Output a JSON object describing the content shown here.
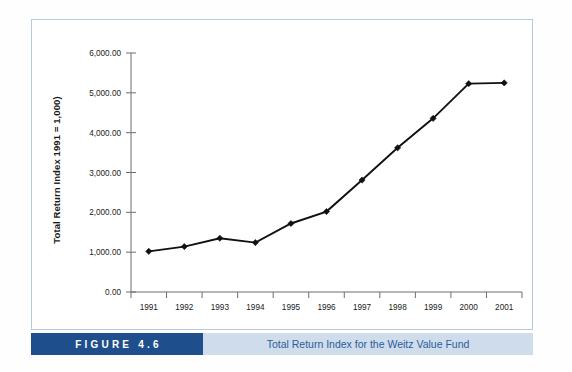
{
  "figure": {
    "number_label": "FIGURE 4.6",
    "caption": "Total Return Index for the Weitz Value Fund"
  },
  "colors": {
    "figure_block_bg": "#1f4e8c",
    "caption_block_bg": "#cfdcec",
    "caption_text": "#2c5c9a",
    "frame_border": "#b9c9dd",
    "series_line": "#111111",
    "axis": "#6d6d6d"
  },
  "chart_data": {
    "type": "line",
    "title": "",
    "xlabel": "",
    "ylabel": "Total Return Index 1991 = 1,000)",
    "categories": [
      "1991",
      "1992",
      "1993",
      "1994",
      "1995",
      "1996",
      "1997",
      "1998",
      "1999",
      "2000",
      "2001"
    ],
    "values": [
      1020,
      1140,
      1350,
      1240,
      1720,
      2020,
      2810,
      3620,
      4360,
      5230,
      5250
    ],
    "series": [
      {
        "name": "Total Return Index",
        "values": [
          1020,
          1140,
          1350,
          1240,
          1720,
          2020,
          2810,
          3620,
          4360,
          5230,
          5250
        ]
      }
    ],
    "ylim": [
      0,
      6000
    ],
    "ytick_values": [
      0,
      1000,
      2000,
      3000,
      4000,
      5000,
      6000
    ],
    "ytick_labels": [
      "0.00",
      "1,000.00",
      "2,000.00",
      "3,000.00",
      "4,000.00",
      "5,000.00",
      "6,000.00"
    ],
    "xtick_labels": [
      "1991",
      "1992",
      "1993",
      "1994",
      "1995",
      "1996",
      "1997",
      "1998",
      "1999",
      "2000",
      "2001"
    ],
    "grid": false,
    "legend": false,
    "legend_position": "none",
    "marker": "diamond"
  }
}
